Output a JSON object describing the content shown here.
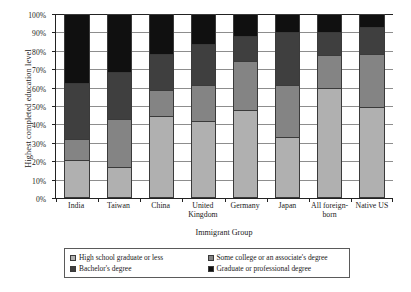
{
  "chart_data": {
    "type": "bar",
    "subtype": "stacked-100-percent",
    "title": "",
    "xlabel": "Immigrant Group",
    "ylabel": "Highest completed education level",
    "ylim": [
      0,
      100
    ],
    "yticks": [
      "0%",
      "10%",
      "20%",
      "30%",
      "40%",
      "50%",
      "60%",
      "70%",
      "80%",
      "90%",
      "100%"
    ],
    "ytick_values": [
      0,
      10,
      20,
      30,
      40,
      50,
      60,
      70,
      80,
      90,
      100
    ],
    "grid": true,
    "legend_position": "bottom",
    "categories": [
      "India",
      "Taiwan",
      "China",
      "United\nKingdom",
      "Germany",
      "Japan",
      "All foreign-\nborn",
      "Native US"
    ],
    "series": [
      {
        "name": "High school graduate or less",
        "color": "#b0b0b0",
        "values": [
          20.0,
          16.0,
          44.5,
          42.0,
          48.0,
          33.0,
          60.5,
          50.0
        ]
      },
      {
        "name": "Some college or an associate's degree",
        "color": "#848484",
        "values": [
          11.5,
          26.5,
          14.0,
          19.5,
          27.0,
          28.5,
          17.5,
          28.5
        ]
      },
      {
        "name": "Bachelor's degree",
        "color": "#3f3f3f",
        "values": [
          30.5,
          25.5,
          19.5,
          22.5,
          13.5,
          29.0,
          12.5,
          15.0
        ]
      },
      {
        "name": "Graduate or professional degree",
        "color": "#101010",
        "values": [
          38.0,
          32.0,
          22.0,
          16.0,
          11.5,
          9.5,
          9.5,
          6.5
        ]
      }
    ]
  },
  "legend": {
    "items": [
      {
        "label": "High school graduate or less",
        "color": "#b0b0b0"
      },
      {
        "label": "Some college or an associate's degree",
        "color": "#848484"
      },
      {
        "label": "Bachelor's degree",
        "color": "#3f3f3f"
      },
      {
        "label": "Graduate or professional degree",
        "color": "#101010"
      }
    ]
  }
}
